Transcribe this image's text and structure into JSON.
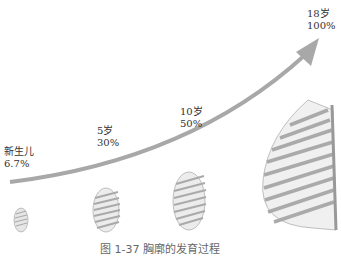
{
  "figure": {
    "caption": "图 1-37  胸廓的发育过程",
    "stages": [
      {
        "age": "新生儿",
        "percent": "6.7%"
      },
      {
        "age": "5岁",
        "percent": "30%"
      },
      {
        "age": "10岁",
        "percent": "50%"
      },
      {
        "age": "18岁",
        "percent": "100%"
      }
    ],
    "arrow_color": "#a8a8a8",
    "rib_color": "#b5b5b5"
  }
}
